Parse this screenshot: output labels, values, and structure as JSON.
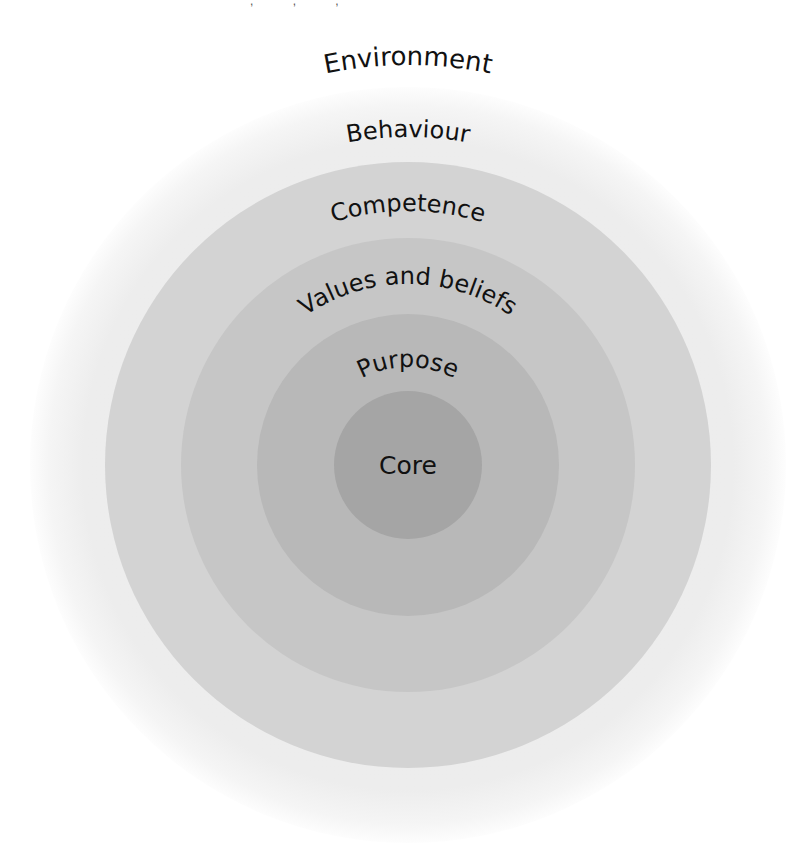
{
  "diagram": {
    "type": "concentric-circles",
    "center": {
      "x": 408,
      "y": 465
    },
    "top_remnant": ", , ,",
    "layers": [
      {
        "id": "environment",
        "label": "Environment",
        "radius": null,
        "color": "#ffffff",
        "label_radius": 398,
        "font_size": 26
      },
      {
        "id": "behaviour",
        "label": "Behaviour",
        "radius": 378,
        "color": "#eeeeee",
        "label_radius": 328,
        "font_size": 24
      },
      {
        "id": "competence",
        "label": "Competence",
        "radius": 303,
        "color": "#d3d3d3",
        "label_radius": 254,
        "font_size": 24
      },
      {
        "id": "values-and-beliefs",
        "label": "Values and beliefs",
        "radius": 227,
        "color": "#c6c6c6",
        "label_radius": 181,
        "font_size": 24
      },
      {
        "id": "purpose",
        "label": "Purpose",
        "radius": 151,
        "color": "#b8b8b8",
        "label_radius": 98,
        "font_size": 24
      },
      {
        "id": "core",
        "label": "Core",
        "radius": 74,
        "color": "#a5a5a5",
        "label_radius": null,
        "font_size": 25
      }
    ]
  }
}
